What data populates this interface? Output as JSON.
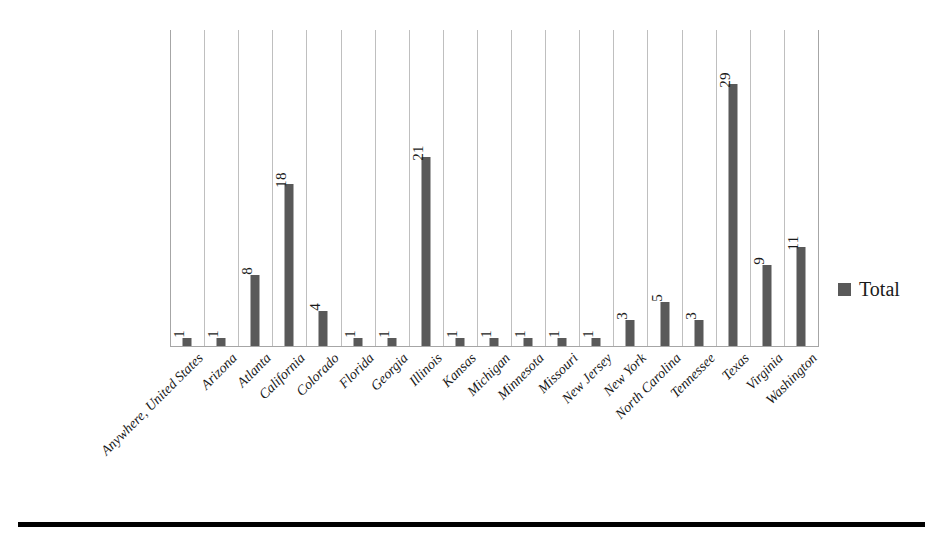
{
  "chart_data": {
    "type": "bar",
    "title": "",
    "subtitle": "",
    "xlabel": "",
    "ylabel": "",
    "grid": "vertical-category-separators",
    "legend_position": "right",
    "ylim": [
      0,
      35
    ],
    "categories": [
      "Anywhere, United States",
      "Arizona",
      "Atlanta",
      "California",
      "Colorado",
      "Florida",
      "Georgia",
      "Illinois",
      "Kansas",
      "Michigan",
      "Minnesota",
      "Missouri",
      "New Jersey",
      "New York",
      "North Carolina",
      "Tennessee",
      "Texas",
      "Virginia",
      "Washington"
    ],
    "series": [
      {
        "name": "Total",
        "color": "#595959",
        "values": [
          1,
          1,
          8,
          18,
          4,
          1,
          1,
          21,
          1,
          1,
          1,
          1,
          1,
          3,
          5,
          3,
          29,
          9,
          11
        ]
      }
    ],
    "data_labels": [
      "1",
      "1",
      "8",
      "18",
      "4",
      "1",
      "1",
      "21",
      "1",
      "1",
      "1",
      "1",
      "1",
      "3",
      "5",
      "3",
      "29",
      "9",
      "11"
    ]
  },
  "legend": {
    "label": "Total",
    "color": "#595959"
  },
  "colors": {
    "bar": "#595959",
    "gridline": "#bfbfbf",
    "axis": "#a6a6a6",
    "text": "#1a1a1a",
    "rule": "#000000",
    "background": "#ffffff"
  }
}
